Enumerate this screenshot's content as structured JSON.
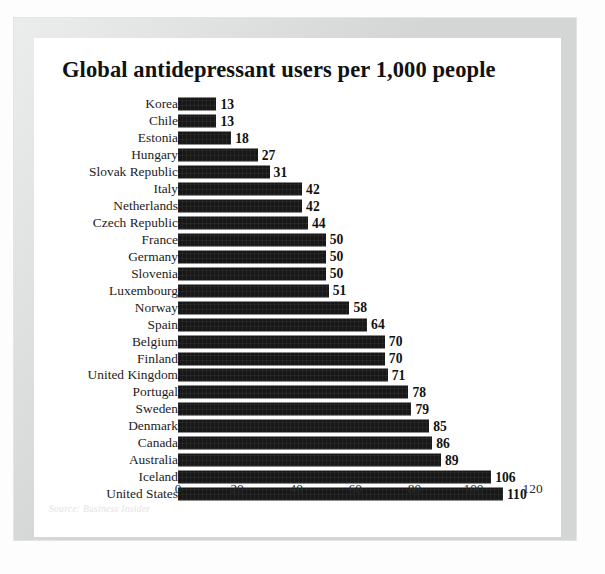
{
  "chart_data": {
    "type": "bar",
    "orientation": "horizontal",
    "title": "Global antidepressant users per 1,000 people",
    "xlabel": "",
    "ylabel": "",
    "xlim": [
      0,
      125
    ],
    "xticks": [
      0,
      20,
      40,
      60,
      80,
      100,
      120
    ],
    "grid": false,
    "legend": null,
    "source": "Source: Business Insider",
    "bar_color": "#171717",
    "categories": [
      "Korea",
      "Chile",
      "Estonia",
      "Hungary",
      "Slovak Republic",
      "Italy",
      "Netherlands",
      "Czech Republic",
      "France",
      "Germany",
      "Slovenia",
      "Luxembourg",
      "Norway",
      "Spain",
      "Belgium",
      "Finland",
      "United Kingdom",
      "Portugal",
      "Sweden",
      "Denmark",
      "Canada",
      "Australia",
      "Iceland",
      "United States"
    ],
    "values": [
      13,
      13,
      18,
      27,
      31,
      42,
      42,
      44,
      50,
      50,
      50,
      51,
      58,
      64,
      70,
      70,
      71,
      78,
      79,
      85,
      86,
      89,
      106,
      110
    ]
  }
}
